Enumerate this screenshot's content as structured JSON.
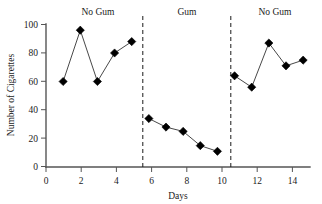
{
  "chart_data": {
    "type": "line",
    "title": "",
    "xlabel": "Days",
    "ylabel": "Number of Cigarettes",
    "xlim": [
      0,
      15.4
    ],
    "ylim": [
      0,
      100
    ],
    "grid": false,
    "legend": "none",
    "marker": "filled-diamond",
    "x": [
      1,
      2,
      3,
      4,
      5,
      6,
      7,
      8,
      9,
      10,
      11,
      12,
      13,
      14,
      15
    ],
    "values": [
      60,
      96,
      60,
      80,
      88,
      34,
      28,
      25,
      15,
      11,
      64,
      56,
      87,
      71,
      75
    ],
    "series": [
      {
        "name": "No Gum (Baseline)",
        "x": [
          1,
          2,
          3,
          4,
          5
        ],
        "values": [
          60,
          96,
          60,
          80,
          88
        ]
      },
      {
        "name": "Gum (Treatment)",
        "x": [
          6,
          7,
          8,
          9,
          10
        ],
        "values": [
          34,
          28,
          25,
          15,
          11
        ]
      },
      {
        "name": "No Gum (Reversal)",
        "x": [
          11,
          12,
          13,
          14,
          15
        ],
        "values": [
          64,
          56,
          87,
          71,
          75
        ]
      }
    ],
    "xticks": [
      0,
      2,
      4,
      6,
      8,
      10,
      12,
      14
    ],
    "xticklabels": [
      "0",
      "2",
      "4",
      "6",
      "8",
      "10",
      "12",
      "14"
    ],
    "yticks": [
      0,
      20,
      40,
      60,
      80,
      100
    ],
    "yticklabels": [
      "0",
      "20",
      "40",
      "60",
      "80",
      "100"
    ],
    "phase_dividers": [
      5.5,
      10.5
    ],
    "annotations": [
      {
        "text": "No Gum",
        "x": 3,
        "y": 108
      },
      {
        "text": "Gum",
        "x": 8,
        "y": 108
      },
      {
        "text": "No Gum",
        "x": 13,
        "y": 108
      }
    ],
    "colors": {
      "marker": "#000000",
      "line": "#333333",
      "axis": "#555555",
      "divider": "#1a1a1a",
      "background": "#ffffff"
    }
  },
  "axes": {
    "x_title": "Days",
    "y_title": "Number of Cigarettes"
  },
  "phase_labels": {
    "first": "No Gum",
    "second": "Gum",
    "third": "No Gum"
  },
  "y_tick_labels": {
    "t0": "0",
    "t20": "20",
    "t40": "40",
    "t60": "60",
    "t80": "80",
    "t100": "100"
  },
  "x_tick_labels": {
    "t0": "0",
    "t2": "2",
    "t4": "4",
    "t6": "6",
    "t8": "8",
    "t10": "10",
    "t12": "12",
    "t14": "14"
  }
}
